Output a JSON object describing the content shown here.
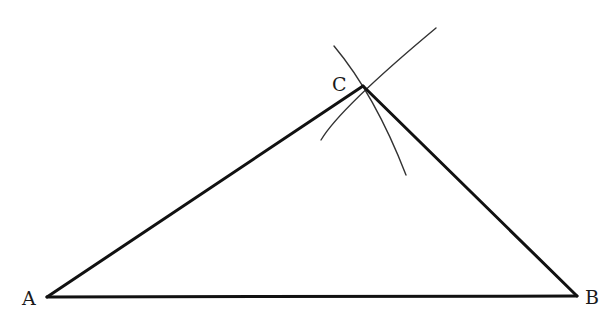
{
  "diagram": {
    "type": "geometric-construction",
    "vertices": [
      {
        "id": "A",
        "label": "A",
        "x": 47,
        "y": 297,
        "label_x": 22,
        "label_y": 305
      },
      {
        "id": "B",
        "label": "B",
        "x": 577,
        "y": 296,
        "label_x": 585,
        "label_y": 304
      },
      {
        "id": "C",
        "label": "C",
        "x": 363,
        "y": 86,
        "label_x": 332,
        "label_y": 91
      }
    ],
    "sides": [
      {
        "from": "A",
        "to": "B"
      },
      {
        "from": "A",
        "to": "C"
      },
      {
        "from": "B",
        "to": "C"
      }
    ],
    "arcs": [
      {
        "name": "arc-from-a",
        "start": [
          321,
          140
        ],
        "control": [
          340,
          108
        ],
        "end": [
          436,
          28
        ]
      },
      {
        "name": "arc-from-b",
        "start": [
          334,
          46
        ],
        "control": [
          375,
          95
        ],
        "end": [
          406,
          175
        ]
      }
    ],
    "colors": {
      "stroke": "#111111",
      "arc": "#333333",
      "background": "#ffffff"
    }
  }
}
